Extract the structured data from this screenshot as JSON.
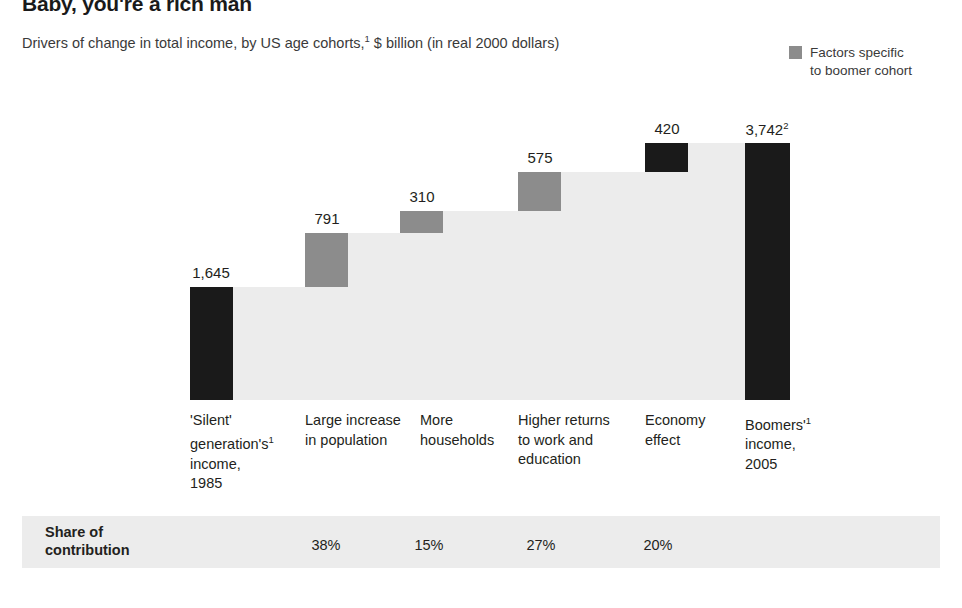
{
  "title": "Baby, you're a rich man",
  "subtitle": "Drivers of change in total income, by US age cohorts,¹ $ billion (in real 2000 dollars)",
  "legend": {
    "swatch_color": "#8c8c8c",
    "line1": "Factors specific",
    "line2": "to boomer cohort"
  },
  "share_row": {
    "label_line1": "Share of",
    "label_line2": "contribution"
  },
  "chart_data": {
    "type": "bar",
    "subtype": "waterfall",
    "title": "Baby, you're a rich man",
    "subtitle": "Drivers of change in total income, by US age cohorts,¹ $ billion (in real 2000 dollars)",
    "xlabel": "",
    "ylabel": "$ billion (in real 2000 dollars)",
    "ylim": [
      0,
      3742
    ],
    "grid": false,
    "legend_position": "top-right",
    "legend_entries": [
      {
        "label": "Factors specific to boomer cohort",
        "color": "#8c8c8c"
      }
    ],
    "categories": [
      "'Silent' generation's¹ income, 1985",
      "Large increase in population",
      "More households",
      "Higher returns to work and education",
      "Economy effect",
      "Boomers'¹ income, 2005"
    ],
    "values": [
      1645,
      791,
      310,
      575,
      420,
      3742
    ],
    "value_labels": [
      "1,645",
      "791",
      "310",
      "575",
      "420",
      "3,742²"
    ],
    "bar_kinds": [
      "total",
      "delta",
      "delta",
      "delta",
      "delta",
      "total"
    ],
    "bar_colors": [
      "#1a1a1a",
      "#8c8c8c",
      "#8c8c8c",
      "#8c8c8c",
      "#1a1a1a",
      "#1a1a1a"
    ],
    "cumulative_base": [
      0,
      1645,
      2436,
      2746,
      3321,
      0
    ],
    "cumulative_top": [
      1645,
      2436,
      2746,
      3321,
      3741,
      3742
    ],
    "share_of_contribution": [
      "",
      "38%",
      "15%",
      "27%",
      "20%",
      ""
    ]
  },
  "bars": [
    {
      "value_label": "1,645",
      "label_l1": "'Silent'",
      "label_l2": "generation's¹",
      "label_l3": "income,",
      "label_l4": "1985",
      "share": ""
    },
    {
      "value_label": "791",
      "label_l1": "Large increase",
      "label_l2": "in population",
      "label_l3": "",
      "label_l4": "",
      "share": "38%"
    },
    {
      "value_label": "310",
      "label_l1": "More",
      "label_l2": "households",
      "label_l3": "",
      "label_l4": "",
      "share": "15%"
    },
    {
      "value_label": "575",
      "label_l1": "Higher returns",
      "label_l2": "to work and",
      "label_l3": "education",
      "label_l4": "",
      "share": "27%"
    },
    {
      "value_label": "420",
      "label_l1": "Economy",
      "label_l2": "effect",
      "label_l3": "",
      "label_l4": "",
      "share": "20%"
    },
    {
      "value_label": "3,742",
      "value_sup": "2",
      "label_l1": "Boomers'¹",
      "label_l2": "income,",
      "label_l3": "2005",
      "label_l4": "",
      "share": ""
    }
  ]
}
